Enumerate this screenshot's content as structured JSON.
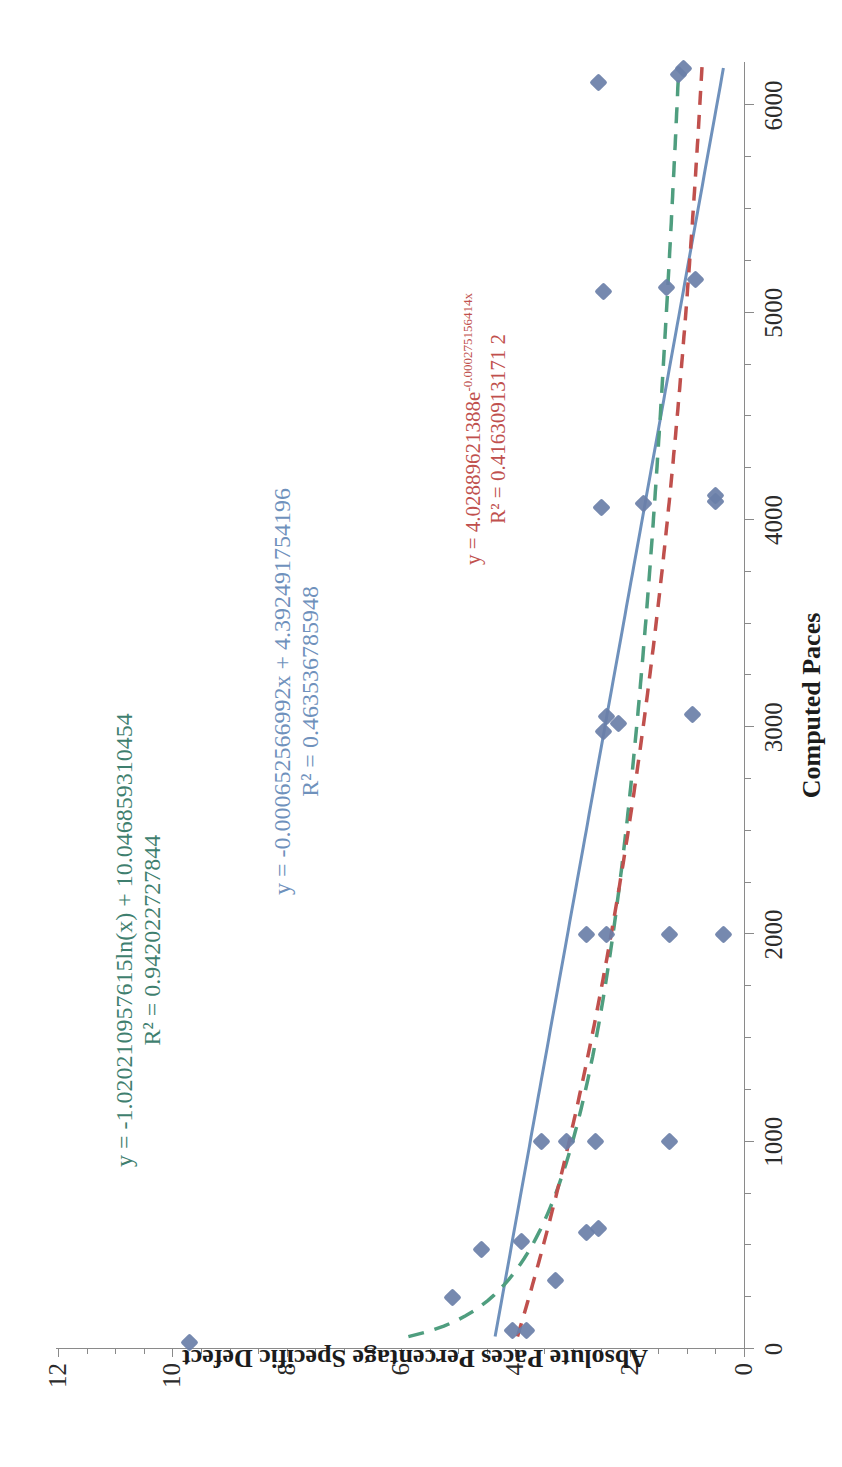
{
  "chart_data": {
    "type": "scatter",
    "title": "",
    "xlabel": "Computed Paces",
    "ylabel": "Absolute Paces Percentage Specific Defect",
    "xlim": [
      0,
      6200
    ],
    "ylim": [
      0,
      12
    ],
    "x_ticks": [
      0,
      1000,
      2000,
      3000,
      4000,
      5000,
      6000
    ],
    "x_tick_labels": [
      "0",
      "1000",
      "2000",
      "3000",
      "4000",
      "5000",
      "6000"
    ],
    "x_minor_step": 250,
    "y_ticks": [
      0,
      2,
      4,
      6,
      8,
      10,
      12
    ],
    "y_tick_labels": [
      "0",
      "2",
      "4",
      "6",
      "8",
      "10",
      "12"
    ],
    "y_minor_step": 0.5,
    "grid": false,
    "legend": "none",
    "marker": "diamond",
    "marker_color": "#6a7fa8",
    "points": [
      {
        "x": 30,
        "y": 9.7
      },
      {
        "x": 90,
        "y": 4.05
      },
      {
        "x": 90,
        "y": 3.8
      },
      {
        "x": 250,
        "y": 5.1
      },
      {
        "x": 330,
        "y": 3.3
      },
      {
        "x": 480,
        "y": 4.6
      },
      {
        "x": 520,
        "y": 3.9
      },
      {
        "x": 560,
        "y": 2.75
      },
      {
        "x": 580,
        "y": 2.55
      },
      {
        "x": 1000,
        "y": 3.55
      },
      {
        "x": 1000,
        "y": 3.1
      },
      {
        "x": 1000,
        "y": 2.6
      },
      {
        "x": 1000,
        "y": 1.3
      },
      {
        "x": 2000,
        "y": 2.75
      },
      {
        "x": 2000,
        "y": 2.4
      },
      {
        "x": 2000,
        "y": 1.3
      },
      {
        "x": 2000,
        "y": 0.35
      },
      {
        "x": 2980,
        "y": 2.45
      },
      {
        "x": 3020,
        "y": 2.2
      },
      {
        "x": 3050,
        "y": 2.4
      },
      {
        "x": 3060,
        "y": 0.9
      },
      {
        "x": 4060,
        "y": 2.5
      },
      {
        "x": 4080,
        "y": 1.75
      },
      {
        "x": 4090,
        "y": 0.5
      },
      {
        "x": 4120,
        "y": 0.5
      },
      {
        "x": 5100,
        "y": 2.45
      },
      {
        "x": 5120,
        "y": 1.35
      },
      {
        "x": 5160,
        "y": 0.85
      },
      {
        "x": 6110,
        "y": 2.55
      },
      {
        "x": 6150,
        "y": 1.15
      },
      {
        "x": 6180,
        "y": 1.05
      }
    ],
    "trendlines": [
      {
        "name": "logarithmic",
        "color": "#4f9e7f",
        "style": "dashed",
        "equation": "y = -1.020210957615ln(x) + 10.046859310454",
        "r2_label": "R² = 0.942022727844",
        "r2": 0.942022727844,
        "a": -1.020210957615,
        "b": 10.046859310454
      },
      {
        "name": "linear",
        "color": "#6f91bc",
        "style": "solid",
        "equation": "y = -0.000652566992x + 4.392491754196",
        "r2_label": "R² = 0.463536785948",
        "r2": 0.463536785948,
        "slope": -0.000652566992,
        "intercept": 4.392491754196
      },
      {
        "name": "exponential",
        "color": "#c0504d",
        "style": "dashed",
        "equation_prefix": "y = 4.02889621388e",
        "equation_exponent": "-0.000275156414x",
        "equation": "y = 4.02889621388e^-0.000275156414x",
        "r2_label": "R² = 0.41630913171 2",
        "r2": 0.416309131712,
        "a": 4.02889621388,
        "b": -0.000275156414
      }
    ]
  }
}
